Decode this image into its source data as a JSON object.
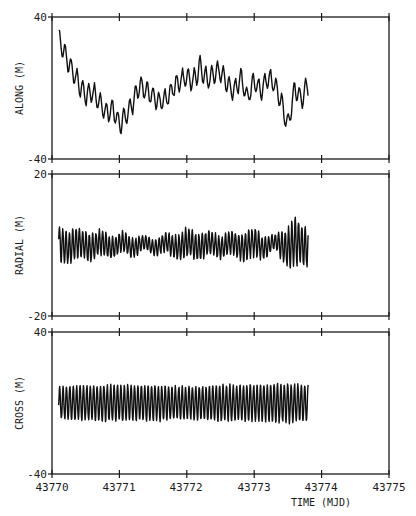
{
  "chart_data": [
    {
      "type": "line",
      "panel": "top",
      "ylabel": "ALONG (M)",
      "ylim": [
        -40,
        40
      ],
      "ytick_labels": [
        "40",
        "-40"
      ],
      "xlim": [
        43770,
        43775
      ],
      "x_start": 43770.1,
      "x_end": 43773.8,
      "description": "Noisy oscillating along-track residual; starts near +30 m, drops to about -20 m near 43771, rises to about +15 m around 43772, then fluctuates between -25 and +10 m until 43773.8",
      "x": [
        43770.1,
        43770.2,
        43770.3,
        43770.4,
        43770.5,
        43770.6,
        43770.7,
        43770.8,
        43770.9,
        43771.0,
        43771.1,
        43771.2,
        43771.3,
        43771.4,
        43771.5,
        43771.6,
        43771.7,
        43771.8,
        43771.9,
        43772.0,
        43772.1,
        43772.2,
        43772.3,
        43772.4,
        43772.5,
        43772.6,
        43772.7,
        43772.8,
        43772.9,
        43773.0,
        43773.1,
        43773.2,
        43773.3,
        43773.4,
        43773.5,
        43773.6,
        43773.7,
        43773.8
      ],
      "values": [
        28,
        18,
        10,
        2,
        -4,
        -2,
        -8,
        -14,
        -12,
        -20,
        -16,
        -8,
        2,
        -2,
        -4,
        -8,
        -6,
        0,
        4,
        6,
        4,
        12,
        4,
        8,
        10,
        2,
        -2,
        6,
        -6,
        4,
        -2,
        6,
        2,
        -8,
        -22,
        0,
        -6,
        2
      ]
    },
    {
      "type": "line",
      "panel": "middle",
      "ylabel": "RADIAL (M)",
      "ylim": [
        -20,
        20
      ],
      "ytick_labels": [
        "20",
        "-20"
      ],
      "xlim": [
        43770,
        43775
      ],
      "x_start": 43770.1,
      "x_end": 43773.8,
      "description": "High-frequency oscillation centered near 0 m with amplitude about +/-4 m, damping around 43772 and growing to about +/-7 m near 43773.6",
      "amplitude_envelope": {
        "x": [
          43770.1,
          43770.5,
          43771.0,
          43771.5,
          43772.0,
          43772.5,
          43773.0,
          43773.3,
          43773.6,
          43773.8
        ],
        "amp": [
          5,
          4,
          3,
          2,
          4,
          3,
          4,
          2,
          7,
          5
        ]
      }
    },
    {
      "type": "line",
      "panel": "bottom",
      "ylabel": "CROSS (M)",
      "ylim": [
        -40,
        40
      ],
      "ytick_labels": [
        "40",
        "-40"
      ],
      "xlim": [
        43770,
        43775
      ],
      "xtick_labels": [
        "43770",
        "43771",
        "43772",
        "43773",
        "43774",
        "43775"
      ],
      "xlabel": "TIME (MJD)",
      "x_start": 43770.1,
      "x_end": 43773.8,
      "description": "Regular sinusoidal oscillation centered near 0 m with amplitude about +/-10 m, roughly 2 cycles per 0.1 day",
      "amplitude_envelope": {
        "x": [
          43770.1,
          43770.5,
          43771.0,
          43771.5,
          43772.0,
          43772.5,
          43773.0,
          43773.5,
          43773.8
        ],
        "amp": [
          9,
          10,
          10,
          10,
          9,
          10,
          10,
          11,
          10
        ]
      }
    }
  ],
  "labels": {
    "along": "ALONG (M)",
    "radial": "RADIAL (M)",
    "cross": "CROSS (M)",
    "xlabel": "TIME (MJD)",
    "top_ymax": "40",
    "top_ymin": "-40",
    "mid_ymax": "20",
    "mid_ymin": "-20",
    "bot_ymax": "40",
    "bot_ymin": "-40",
    "xticks": [
      "43770",
      "43771",
      "43772",
      "43773",
      "43774",
      "43775"
    ]
  }
}
